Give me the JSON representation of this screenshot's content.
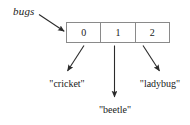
{
  "diagram": {
    "variable": {
      "name_label": "bugs",
      "pointer_arrow": "arrow-to-array"
    },
    "array": {
      "cells": [
        {
          "index_label": "0",
          "value_label": "\"cricket\""
        },
        {
          "index_label": "1",
          "value_label": "\"beetle\""
        },
        {
          "index_label": "2",
          "value_label": "\"ladybug\""
        }
      ]
    },
    "colors": {
      "background": "#ffffff",
      "border": "#8a8a8a",
      "text": "#1a1a1a",
      "arrow": "#2b2b2b"
    }
  }
}
